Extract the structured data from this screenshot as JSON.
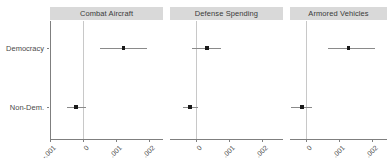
{
  "chart_data": {
    "type": "scatter",
    "title": "",
    "xlabel": "",
    "ylabel": "",
    "grid": false,
    "legend_position": "none",
    "facet_labels": [
      "Combat Aircraft",
      "Defense Spending",
      "Armored Vehicles"
    ],
    "categories": [
      "Democracy",
      "Non-Dem."
    ],
    "x_tick_labels": [
      "-.001",
      "0",
      ".001",
      ".002"
    ],
    "x_tick_values": [
      -0.001,
      0,
      0.001,
      0.002
    ],
    "xlim": [
      -0.0012,
      0.0021
    ],
    "reference_line": 0,
    "panels": [
      {
        "label": "Combat Aircraft",
        "points": [
          {
            "category": "Democracy",
            "estimate": 0.00122,
            "ci_low": 0.00053,
            "ci_high": 0.00194
          },
          {
            "category": "Non-Dem.",
            "estimate": -0.00021,
            "ci_low": -0.00049,
            "ci_high": 9e-05
          }
        ]
      },
      {
        "label": "Defense Spending",
        "points": [
          {
            "category": "Democracy",
            "estimate": 0.00033,
            "ci_low": -0.00012,
            "ci_high": 0.00077
          },
          {
            "category": "Non-Dem.",
            "estimate": -0.00018,
            "ci_low": -0.00039,
            "ci_high": 5e-05
          }
        ]
      },
      {
        "label": "Armored Vehicles",
        "points": [
          {
            "category": "Democracy",
            "estimate": 0.00128,
            "ci_low": 0.00068,
            "ci_high": 0.0021
          },
          {
            "category": "Non-Dem.",
            "estimate": -0.00012,
            "ci_low": -0.00046,
            "ci_high": 0.00017
          }
        ]
      }
    ],
    "colors": {
      "point": "#1a1a1a",
      "whisker": "#8a8a8a",
      "reference_line": "#c8c8c8",
      "strip_background": "#d9d9d9",
      "axis": "#7f7f7f",
      "text": "#4a4a4a",
      "background": "#ffffff"
    }
  },
  "axis": {
    "y_labels": [
      "Democracy",
      "Non-Dem."
    ],
    "x_labels": [
      "-.001",
      "0",
      ".001",
      ".002"
    ]
  },
  "strips": {
    "panel1": "Combat Aircraft",
    "panel2": "Defense Spending",
    "panel3": "Armored Vehicles"
  }
}
